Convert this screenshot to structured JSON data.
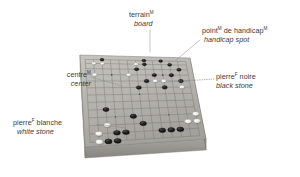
{
  "figure": {
    "background_color": "#ffffff",
    "text_color": "#3a3a3a"
  },
  "labels": [
    {
      "id": "board",
      "fr": "terrain",
      "fr_sup": "M",
      "en": "board",
      "anchor": "top-center"
    },
    {
      "id": "handicap-spot",
      "fr": "point",
      "fr_sup": "M",
      "fr_tail": " de handicap",
      "fr_tail_sup": "M",
      "en": "handicap spot",
      "anchor": "top-right"
    },
    {
      "id": "black-stone",
      "fr": "pierre",
      "fr_sup": "F",
      "fr_tail": " noire",
      "en": "black stone",
      "anchor": "right"
    },
    {
      "id": "center",
      "fr": "centre",
      "fr_sup": "M",
      "en": "center",
      "anchor": "left"
    },
    {
      "id": "white-stone",
      "fr": "pierre",
      "fr_sup": "F",
      "fr_tail": " blanche",
      "en": "white stone",
      "anchor": "bottom-left"
    }
  ],
  "board": {
    "grid_lines": 13,
    "surface_color": "#b9b7b2",
    "surface_color_dark": "#9d9b96",
    "edge_color": "#8e8c87",
    "side_color": "#a9a7a2",
    "front_color": "#9a9893",
    "grid_color": "#6e6c68",
    "corners": {
      "top_left": [
        80,
        55
      ],
      "top_right": [
        190,
        58
      ],
      "bottom_right": [
        206,
        139
      ],
      "bottom_left": [
        85,
        147
      ]
    },
    "thickness": 11
  },
  "stones": {
    "black_color": "#1c1c1c",
    "white_color": "#e8e8e6",
    "black": [
      [
        2,
        0
      ],
      [
        7,
        0
      ],
      [
        9,
        0
      ],
      [
        10,
        1
      ],
      [
        7,
        1
      ],
      [
        11,
        2
      ],
      [
        6,
        2
      ],
      [
        8,
        3
      ],
      [
        10,
        3
      ],
      [
        7,
        4
      ],
      [
        11,
        4
      ],
      [
        6,
        5
      ],
      [
        9,
        5
      ],
      [
        2,
        8
      ],
      [
        5,
        9
      ],
      [
        6,
        10
      ],
      [
        3,
        11
      ],
      [
        4,
        11
      ],
      [
        8,
        11
      ],
      [
        9,
        11
      ],
      [
        10,
        11
      ],
      [
        2,
        12
      ],
      [
        3,
        12
      ]
    ],
    "white": [
      [
        1,
        1
      ],
      [
        2,
        1
      ],
      [
        6,
        1
      ],
      [
        1,
        3
      ],
      [
        5,
        3
      ],
      [
        8,
        4
      ],
      [
        9,
        4
      ],
      [
        11,
        5
      ],
      [
        2,
        10
      ],
      [
        12,
        9
      ],
      [
        12,
        10
      ],
      [
        11,
        10
      ],
      [
        1,
        11
      ],
      [
        1,
        12
      ]
    ]
  },
  "leaders": [
    {
      "id": "leader-board",
      "type": "solid",
      "from": [
        150,
        30
      ],
      "to": [
        150,
        52
      ]
    },
    {
      "id": "leader-handicap",
      "type": "solid",
      "from": [
        200,
        40
      ],
      "to": [
        176,
        60
      ]
    },
    {
      "id": "leader-black",
      "type": "dotted",
      "from": [
        214,
        79
      ],
      "to": [
        168,
        82
      ]
    },
    {
      "id": "leader-centre",
      "type": "dotted",
      "from": [
        91,
        77
      ],
      "to": [
        122,
        86
      ]
    },
    {
      "id": "leader-white",
      "type": "solid",
      "from": [
        96,
        124
      ],
      "to": [
        126,
        128
      ]
    }
  ]
}
